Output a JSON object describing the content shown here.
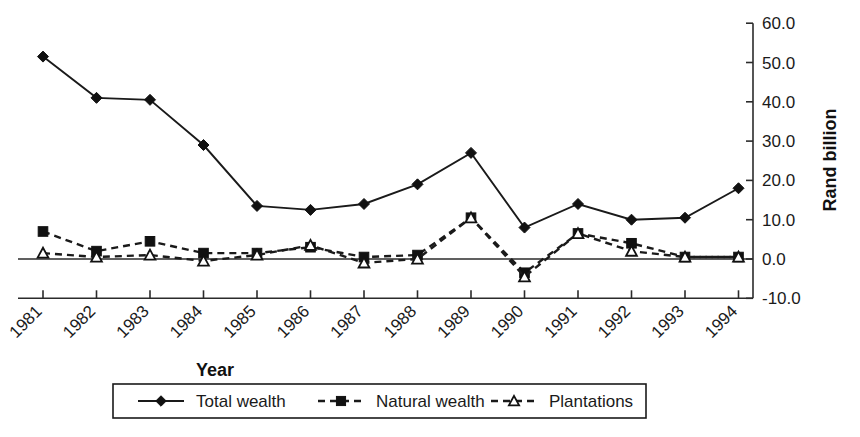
{
  "chart_data": {
    "type": "line",
    "title": "",
    "xlabel": "Year",
    "ylabel": "Rand billion",
    "categories": [
      "1981",
      "1982",
      "1983",
      "1984",
      "1985",
      "1986",
      "1987",
      "1988",
      "1989",
      "1990",
      "1991",
      "1992",
      "1993",
      "1994"
    ],
    "ylim": [
      -10.0,
      60.0
    ],
    "ytick_labels": [
      "60.0",
      "50.0",
      "40.0",
      "30.0",
      "20.0",
      "10.0",
      "0.0",
      "-10.0"
    ],
    "ytick_values": [
      60.0,
      50.0,
      40.0,
      30.0,
      20.0,
      10.0,
      0.0,
      -10.0
    ],
    "grid": false,
    "legend_position": "bottom",
    "y_axis_side": "right",
    "xtick_label_rotation": -45,
    "series": [
      {
        "name": "Total wealth",
        "marker": "filled-diamond",
        "line_style": "solid",
        "color": "#111111",
        "values": [
          51.5,
          41.0,
          40.5,
          29.0,
          13.5,
          12.5,
          14.0,
          19.0,
          27.0,
          8.0,
          14.0,
          10.0,
          10.5,
          18.0
        ]
      },
      {
        "name": "Natural wealth",
        "marker": "filled-square",
        "line_style": "dashed",
        "color": "#111111",
        "values": [
          7.0,
          2.0,
          4.5,
          1.5,
          1.5,
          3.0,
          0.5,
          1.0,
          10.5,
          -3.5,
          6.5,
          4.0,
          0.5,
          0.5
        ]
      },
      {
        "name": "Plantations",
        "marker": "open-triangle",
        "line_style": "dashed",
        "color": "#111111",
        "values": [
          1.5,
          0.5,
          1.0,
          -0.5,
          1.0,
          3.5,
          -1.0,
          0.0,
          10.5,
          -4.5,
          6.5,
          2.0,
          0.5,
          0.5
        ]
      }
    ]
  },
  "legend": {
    "items": [
      {
        "label": "Total wealth",
        "marker": "filled-diamond",
        "line_style": "solid"
      },
      {
        "label": "Natural wealth",
        "marker": "filled-square",
        "line_style": "dashed"
      },
      {
        "label": "Plantations",
        "marker": "open-triangle",
        "line_style": "dashed"
      }
    ]
  }
}
